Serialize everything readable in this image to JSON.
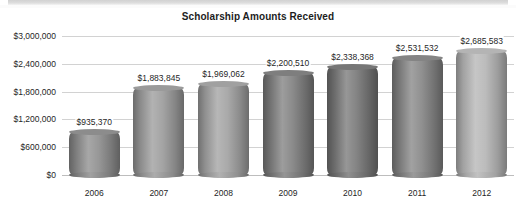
{
  "chart_data": {
    "type": "bar",
    "title": "Scholarship Amounts Received",
    "xlabel": "",
    "ylabel": "",
    "categories": [
      "2006",
      "2007",
      "2008",
      "2009",
      "2010",
      "2011",
      "2012"
    ],
    "values": [
      935370,
      1883845,
      1969062,
      2200510,
      2338368,
      2531532,
      2685583
    ],
    "value_labels": [
      "$935,370",
      "$1,883,845",
      "$1,969,062",
      "$2,200,510",
      "$2,338,368",
      "$2,531,532",
      "$2,685,583"
    ],
    "ylim": [
      0,
      3000000
    ],
    "ytick_values": [
      0,
      600000,
      1200000,
      1800000,
      2400000,
      3000000
    ],
    "ytick_labels": [
      "$0",
      "$600,000",
      "$1,200,000",
      "$1,800,000",
      "$2,400,000",
      "$3,000,000"
    ],
    "grid": true,
    "legend": false,
    "bar_style": "3d-cylinder",
    "bar_colors": [
      "#8c8c8c",
      "#9a9a9a",
      "#a0a0a0",
      "#7e7e7e",
      "#767676",
      "#848484",
      "#b4b4b4"
    ],
    "gridline_color": "#d2d2d2",
    "background_color": "#ffffff",
    "title_color": "#1d1d1d"
  }
}
